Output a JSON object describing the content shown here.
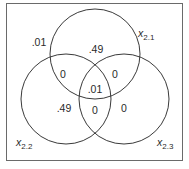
{
  "diagram": {
    "type": "venn-3",
    "sets": [
      {
        "id": "x21",
        "var": "x",
        "sub": "2.1"
      },
      {
        "id": "x22",
        "var": "x",
        "sub": "2.2"
      },
      {
        "id": "x23",
        "var": "x",
        "sub": "2.3"
      }
    ],
    "regions": {
      "outside": ".01",
      "only_x21": ".49",
      "only_x22": ".49",
      "only_x23": "0",
      "x21_x22": "0",
      "x21_x23": "0",
      "x22_x23": "0",
      "all_three": ".01"
    },
    "colors": {
      "stroke": "#3a3a3a",
      "frame": "#6a6a6a",
      "text": "#2a2a2a"
    }
  }
}
